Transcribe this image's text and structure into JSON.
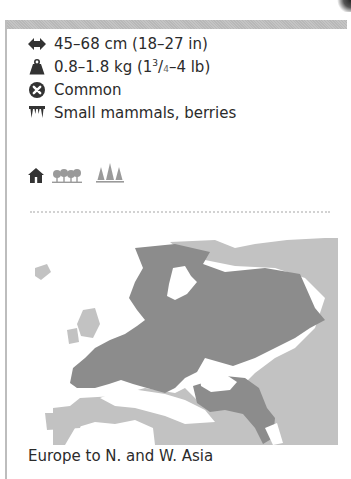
{
  "facts": {
    "length": {
      "icon": "length-arrows-icon",
      "text": "45–68 cm (18–27 in)"
    },
    "weight": {
      "icon": "weight-icon",
      "text_main": "0.8–1.8 kg (1",
      "sup": "3",
      "slash": "/",
      "sub": "4",
      "text_end": "–4 lb)"
    },
    "status": {
      "icon": "status-common-icon",
      "text": "Common"
    },
    "diet": {
      "icon": "teeth-icon",
      "text": "Small mammals, berries"
    }
  },
  "habitat": {
    "icons": [
      "house-icon",
      "deciduous-forest-icon",
      "coniferous-forest-icon"
    ],
    "colors": {
      "active": "#333333",
      "inactive": "#9a9a9a"
    }
  },
  "map": {
    "region": "Europe",
    "colors": {
      "range": "#8c8c8c",
      "land": "#c2c2c2",
      "sea": "#ffffff"
    }
  },
  "caption": "Europe to N. and W. Asia"
}
